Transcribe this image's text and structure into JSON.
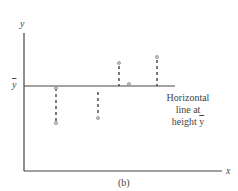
{
  "diagram": {
    "y_axis_label": "y",
    "x_axis_label": "x",
    "ybar_label": "y",
    "annotation": {
      "line1": "Horizontal",
      "line2": "line at",
      "line3_prefix": "height ",
      "line3_symbol": "y"
    },
    "caption": "(b)",
    "points": [
      {
        "x": 56,
        "y": 123,
        "dash_to": 88
      },
      {
        "x": 98,
        "y": 118,
        "dash_to": 92
      },
      {
        "x": 119,
        "y": 63,
        "dash_to": 86
      },
      {
        "x": 129,
        "y": 84,
        "dash_to": 84
      },
      {
        "x": 157,
        "y": 57,
        "dash_to": 86
      }
    ]
  }
}
